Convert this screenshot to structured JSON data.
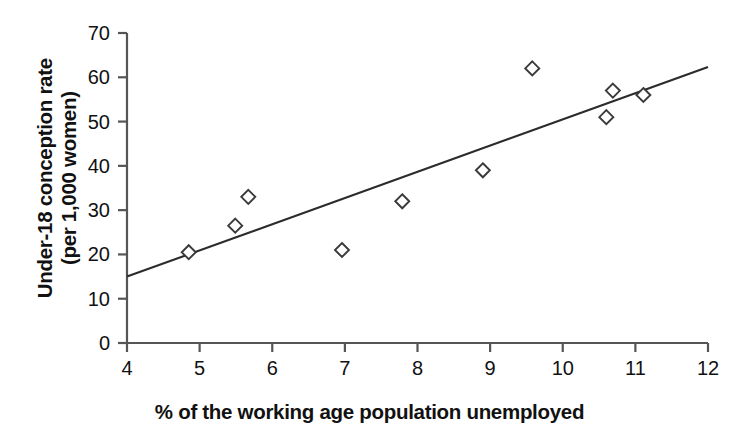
{
  "chart_data": {
    "type": "scatter",
    "title": "",
    "xlabel": "% of the working age population unemployed",
    "ylabel_line1": "Under-18 conception rate",
    "ylabel_line2": "(per 1,000 women)",
    "xlim": [
      4,
      12
    ],
    "ylim": [
      0,
      70
    ],
    "xticks": [
      4,
      5,
      6,
      7,
      8,
      9,
      10,
      11,
      12
    ],
    "xtick_labels": [
      "4",
      "5",
      "6",
      "7",
      "8",
      "9",
      "10",
      "11",
      "12"
    ],
    "yticks": [
      0,
      10,
      20,
      30,
      40,
      50,
      60,
      70
    ],
    "ytick_labels": [
      "0",
      "10",
      "20",
      "30",
      "40",
      "50",
      "60",
      "70"
    ],
    "grid": false,
    "legend": "none",
    "marker": "open-diamond",
    "marker_color": "#3a3a3a",
    "line_color": "#2b2b2b",
    "axis_color": "#555555",
    "points": [
      {
        "x": 4.85,
        "y": 20.5
      },
      {
        "x": 5.49,
        "y": 26.5
      },
      {
        "x": 5.67,
        "y": 33.0
      },
      {
        "x": 6.96,
        "y": 21.0
      },
      {
        "x": 7.79,
        "y": 32.0
      },
      {
        "x": 8.9,
        "y": 39.0
      },
      {
        "x": 9.58,
        "y": 62.0
      },
      {
        "x": 10.6,
        "y": 51.0
      },
      {
        "x": 10.69,
        "y": 57.0
      },
      {
        "x": 11.11,
        "y": 56.0
      }
    ],
    "trendline": {
      "type": "line",
      "x": [
        4,
        12
      ],
      "y": [
        15.0,
        62.3
      ]
    }
  }
}
